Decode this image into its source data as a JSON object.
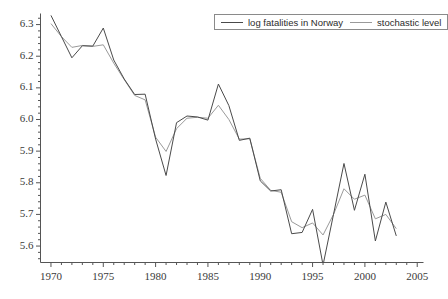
{
  "chart_data": {
    "type": "line",
    "title": "",
    "subtitle": "",
    "xlabel": "",
    "ylabel": "",
    "xlim": [
      1969.0,
      2005.6
    ],
    "ylim": [
      5.548,
      6.335
    ],
    "grid": false,
    "legend_position": "top-right",
    "x_major_ticks": [
      1970,
      1975,
      1980,
      1985,
      1990,
      1995,
      2000,
      2005
    ],
    "x_minor_step": 1,
    "y_major_ticks": [
      5.6,
      5.7,
      5.8,
      5.9,
      6.0,
      6.1,
      6.2,
      6.3
    ],
    "y_tick_labels": [
      "5.6",
      "5.7",
      "5.8",
      "5.9",
      "6.0",
      "6.1",
      "6.2",
      "6.3"
    ],
    "y_minor_step": 0.02,
    "x": [
      1970,
      1971,
      1972,
      1973,
      1974,
      1975,
      1976,
      1977,
      1978,
      1979,
      1980,
      1981,
      1982,
      1983,
      1984,
      1985,
      1986,
      1987,
      1988,
      1989,
      1990,
      1991,
      1992,
      1993,
      1994,
      1995,
      1996,
      1997,
      1998,
      1999,
      2000,
      2001,
      2002,
      2003
    ],
    "series": [
      {
        "name": "log fatalities in Norway",
        "color": "#4a4a4a",
        "linestyle": "solid",
        "linewidth": 1.0,
        "values": [
          6.329,
          6.262,
          6.195,
          6.233,
          6.232,
          6.289,
          6.188,
          6.128,
          6.079,
          6.08,
          5.938,
          5.823,
          5.99,
          6.011,
          6.008,
          5.998,
          6.112,
          6.044,
          5.934,
          5.941,
          5.806,
          5.774,
          5.778,
          5.639,
          5.643,
          5.716,
          5.54,
          5.7,
          5.861,
          5.713,
          5.827,
          5.616,
          5.739,
          5.632
        ]
      },
      {
        "name": "stochastic level",
        "color": "#9a9a9a",
        "linestyle": "solid",
        "linewidth": 1.0,
        "values": [
          6.303,
          6.262,
          6.228,
          6.234,
          6.231,
          6.236,
          6.178,
          6.126,
          6.076,
          6.062,
          5.944,
          5.899,
          5.971,
          6.004,
          6.007,
          6.004,
          6.045,
          6.0,
          5.938,
          5.939,
          5.814,
          5.776,
          5.77,
          5.677,
          5.658,
          5.673,
          5.635,
          5.7,
          5.781,
          5.748,
          5.761,
          5.686,
          5.7,
          5.655
        ]
      }
    ]
  },
  "legend": {
    "entries": [
      {
        "label": "log fatalities in Norway",
        "color": "#4a4a4a"
      },
      {
        "label": "stochastic level",
        "color": "#9a9a9a"
      }
    ]
  },
  "axes": {
    "axis_color": "#555555",
    "background": "#ffffff"
  }
}
